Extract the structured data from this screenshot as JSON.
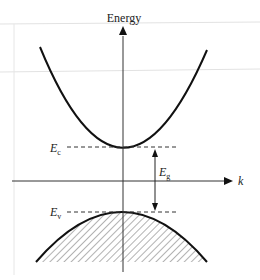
{
  "diagram": {
    "axes": {
      "y_label": "Energy",
      "x_label": "k"
    },
    "levels": {
      "conduction_edge": {
        "symbol": "E",
        "subscript": "c",
        "y": 147
      },
      "valence_edge": {
        "symbol": "E",
        "subscript": "v",
        "y": 212
      }
    },
    "gap": {
      "symbol": "E",
      "subscript": "g"
    },
    "bands": [
      {
        "name": "conduction band",
        "shape": "upward parabola",
        "filled": false
      },
      {
        "name": "valence band",
        "shape": "downward parabola",
        "filled": true,
        "fill_style": "diagonal hatch"
      }
    ],
    "colors": {
      "ink": "#111111",
      "axis": "#333333",
      "hatch": "#666666",
      "grid": "#d8d8d8"
    }
  }
}
